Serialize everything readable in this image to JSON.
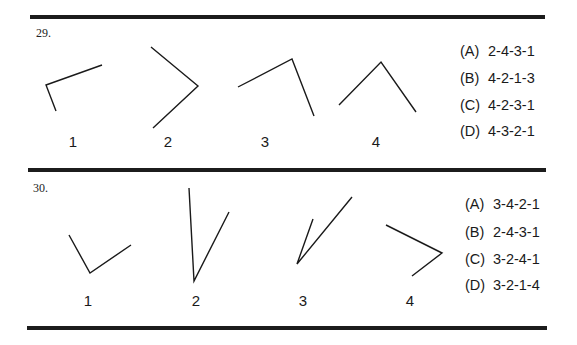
{
  "questions": [
    {
      "number": "29.",
      "figures": [
        {
          "label": "1",
          "points": "102,65 46,85 56,111"
        },
        {
          "label": "2",
          "points": "151,47 198,86 153,128"
        },
        {
          "label": "3",
          "points": "238,87 292,59 314,116"
        },
        {
          "label": "4",
          "points": "339,105 381,62 416,112"
        }
      ],
      "options": [
        {
          "letter": "(A)",
          "value": "2-4-3-1"
        },
        {
          "letter": "(B)",
          "value": "4-2-1-3"
        },
        {
          "letter": "(C)",
          "value": "4-2-3-1"
        },
        {
          "letter": "(D)",
          "value": "4-3-2-1"
        }
      ]
    },
    {
      "number": "30.",
      "figures": [
        {
          "label": "1",
          "points": "69,235 90,273 131,245"
        },
        {
          "label": "2",
          "points": "189,188 194,281 229,212"
        },
        {
          "label": "3",
          "points": "313,219 297,264 352,197"
        },
        {
          "label": "4",
          "points": "386,225 442,253 412,276"
        }
      ],
      "options": [
        {
          "letter": "(A)",
          "value": "3-4-2-1"
        },
        {
          "letter": "(B)",
          "value": "2-4-3-1"
        },
        {
          "letter": "(C)",
          "value": "3-2-4-1"
        },
        {
          "letter": "(D)",
          "value": "3-2-1-4"
        }
      ]
    }
  ]
}
